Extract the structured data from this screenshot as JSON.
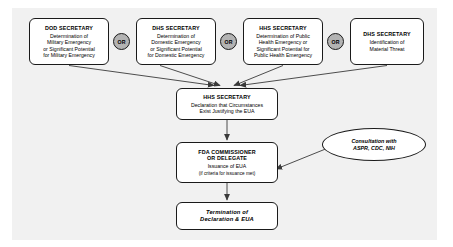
{
  "diagram": {
    "background_color": "#f1f1f1",
    "line_color": "#3a3a3a",
    "or_fill_color": "#b3b3b3"
  },
  "top_row": {
    "boxes": [
      {
        "id": "dod-secretary",
        "title": "DOD SECRETARY",
        "body": "Determination of\nMilitary Emergency\nor Significant Potential\nfor Military Emergency"
      },
      {
        "id": "dhs-secretary-domestic",
        "title": "DHS SECRETARY",
        "body": "Determination of\nDomestic Emergency\nor Significant Potential\nfor Domestic Emergency"
      },
      {
        "id": "hhs-secretary-public-health",
        "title": "HHS SECRETARY",
        "body": "Determination of Public\nHealth Emergency or\nSignificant Potential for\nPublic Health Emergency"
      },
      {
        "id": "dhs-secretary-material-threat",
        "title": "DHS SECRETARY",
        "body": "Identification of\nMaterial Threat"
      }
    ],
    "connectors": [
      {
        "label": "OR"
      },
      {
        "label": "OR"
      },
      {
        "label": "OR"
      }
    ]
  },
  "flow": {
    "hhs_declaration": {
      "title": "HHS SECRETARY",
      "body": "Declaration that Circumstances\nExist Justifying the EUA"
    },
    "fda_commissioner": {
      "title": "FDA COMMISSIONER\nOR DELEGATE",
      "body": "Issuance of EUA",
      "sub": "(if criteria for issuance met)"
    },
    "consultation": {
      "body": "Consultation with\nASPR, CDC, NIH"
    },
    "termination": {
      "title": "Termination of\nDeclaration & EUA"
    }
  }
}
